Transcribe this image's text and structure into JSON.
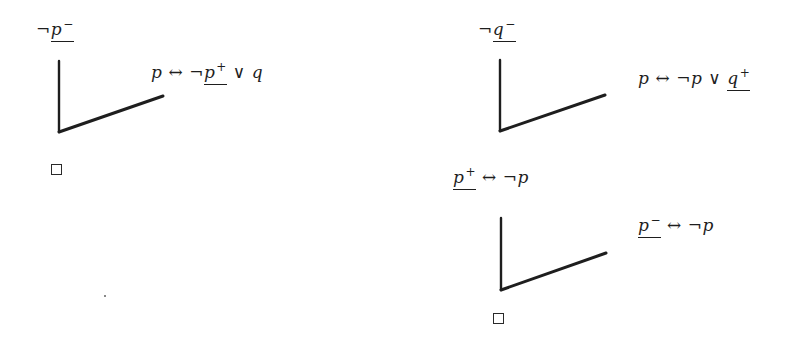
{
  "diagram": {
    "type": "semantic-tableau-proof-trees",
    "colors": {
      "ink": "#1e1e1e",
      "background": "#ffffff"
    },
    "trees": [
      {
        "id": "left",
        "root": {
          "neg": "¬",
          "var": "p",
          "sign": "−",
          "underlined": true
        },
        "branch_label": {
          "parts": [
            {
              "text": "p",
              "kind": "var"
            },
            {
              "text": "↔",
              "kind": "op"
            },
            {
              "text": "¬",
              "kind": "neg"
            },
            {
              "text": "p",
              "kind": "var",
              "sign": "+",
              "underlined": true
            },
            {
              "text": "∨",
              "kind": "op"
            },
            {
              "text": "q",
              "kind": "var"
            }
          ]
        },
        "closed_symbol": "□"
      },
      {
        "id": "right-top",
        "root": {
          "neg": "¬",
          "var": "q",
          "sign": "−",
          "underlined": true
        },
        "branch_label": {
          "parts": [
            {
              "text": "p",
              "kind": "var"
            },
            {
              "text": "↔",
              "kind": "op"
            },
            {
              "text": "¬",
              "kind": "neg"
            },
            {
              "text": "p",
              "kind": "var"
            },
            {
              "text": "∨",
              "kind": "op"
            },
            {
              "text": "q",
              "kind": "var",
              "sign": "+",
              "underlined": true
            }
          ]
        }
      },
      {
        "id": "right-bottom",
        "root": {
          "var": "p",
          "sign": "+",
          "underlined": true,
          "rest": [
            {
              "text": "↔",
              "kind": "op"
            },
            {
              "text": "¬",
              "kind": "neg"
            },
            {
              "text": "p",
              "kind": "var"
            }
          ]
        },
        "branch_label": {
          "var": "p",
          "sign": "−",
          "underlined": true,
          "rest": [
            {
              "text": "↔",
              "kind": "op"
            },
            {
              "text": "¬",
              "kind": "neg"
            },
            {
              "text": "p",
              "kind": "var"
            }
          ]
        },
        "closed_symbol": "□"
      }
    ]
  }
}
